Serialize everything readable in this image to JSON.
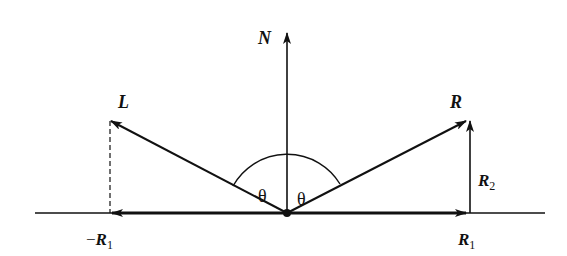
{
  "diagram": {
    "type": "vector-reflection",
    "origin": {
      "x": 287,
      "y": 213
    },
    "labels": {
      "normal": "N",
      "light": "L",
      "reflected": "R",
      "r2": "R",
      "r2_sub": "2",
      "r1": "R",
      "r1_sub": "1",
      "neg_r1_sign": "−",
      "neg_r1": "R",
      "neg_r1_sub": "1",
      "theta_left": "θ",
      "theta_right": "θ"
    },
    "colors": {
      "ink": "#111111",
      "background": "#ffffff"
    }
  }
}
